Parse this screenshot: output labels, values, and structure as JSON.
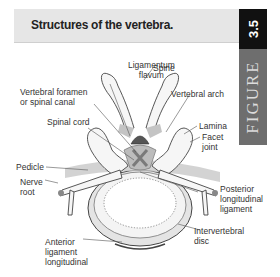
{
  "header": {
    "title": "Structures of the vertebra.",
    "figure_number": "3.5",
    "figure_word": "FIGURE"
  },
  "labels": {
    "ligamentum_flavum_1": "Ligamentum",
    "ligamentum_flavum_2": "flavum",
    "spine": "Spine",
    "vertebral_foramen_1": "Vertebral foramen",
    "vertebral_foramen_2": "or spinal canal",
    "vertebral_arch": "Vertebral arch",
    "spinal_cord": "Spinal cord",
    "lamina": "Lamina",
    "facet_joint_1": "Facet",
    "facet_joint_2": "joint",
    "pedicle": "Pedicle",
    "nerve_root_1": "Nerve",
    "nerve_root_2": "root",
    "posterior_ligament_1": "Posterior",
    "posterior_ligament_2": "longitudinal",
    "posterior_ligament_3": "ligament",
    "intervertebral_disc_1": "Intervertebral",
    "intervertebral_disc_2": "disc",
    "anterior_ligament_1": "Anterior",
    "anterior_ligament_2": "ligament",
    "anterior_ligament_3": "longitudinal"
  },
  "colors": {
    "title_bg": "#e6e6e6",
    "number_tab": "#111111",
    "figure_tab": "#6e6e6e",
    "bone_fill": "#f2f2f2",
    "shade": "#bdbdbd",
    "cord_dark": "#555555",
    "cross_marker": "#8a8a8a"
  }
}
